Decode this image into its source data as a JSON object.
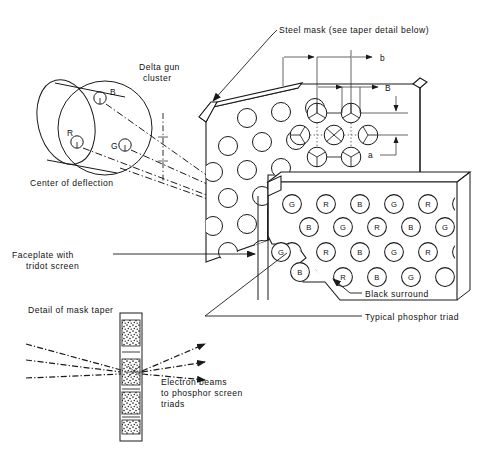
{
  "figure": {
    "type": "technical-line-diagram"
  },
  "labels": {
    "delta_gun_cluster": "Delta gun\ncluster",
    "delta_gun_cluster_line1": "Delta gun",
    "delta_gun_cluster_line2": "cluster",
    "center_of_deflection": "Center of deflection",
    "steel_mask": "Steel mask (see taper detail below)",
    "faceplate_line1": "Faceplate with",
    "faceplate_line2": "tridot screen",
    "black_surround": "Black surround",
    "typical_phosphor_triad": "Typical phosphor triad",
    "detail_of_mask_taper": "Detail of mask taper",
    "electron_beams_line1": "Electron beams",
    "electron_beams_line2": "to phosphor screen",
    "electron_beams_line3": "triads"
  },
  "gun_cluster": {
    "guns": [
      {
        "id": "B",
        "label": "B",
        "cx": 100,
        "cy": 98,
        "label_dx": 9,
        "label_dy": -4
      },
      {
        "id": "R",
        "label": "R",
        "cx": 77,
        "cy": 142,
        "label_dx": -2,
        "label_dy": -9
      },
      {
        "id": "G",
        "label": "G",
        "cx": 125,
        "cy": 145,
        "label_dx": -11,
        "label_dy": 3
      }
    ],
    "gun_radius": 6.2
  },
  "dimensions": [
    {
      "symbol": "b",
      "x": 381,
      "y": 62
    },
    {
      "symbol": "B",
      "x": 385,
      "y": 92
    },
    {
      "symbol": "a",
      "x": 371,
      "y": 152
    }
  ],
  "mask": {
    "description": "perforated steel shadow mask with staggered round apertures",
    "hole_radius": 9.5,
    "detail_hole_radius": 9.8,
    "detail_note": "apertures in detail zone show three-way phosphor wedge division"
  },
  "screen": {
    "description": "faceplate with tridot phosphor screen, black surround",
    "dot_radius": 9.4,
    "rows": [
      [
        "G",
        "R",
        "B",
        "G",
        "R",
        "B"
      ],
      [
        "B",
        "G",
        "R",
        "B",
        "G",
        ""
      ],
      [
        "G",
        "R",
        "B",
        "G",
        "R",
        "B"
      ],
      [
        "",
        "R",
        "B",
        "G",
        ""
      ]
    ],
    "phosphor_letters": [
      "R",
      "G",
      "B"
    ]
  },
  "taper_detail": {
    "caption": "Detail of mask taper",
    "beam_count": 3,
    "strip_segments": 4,
    "note": "tapered apertures through mask thickness"
  },
  "colors": {
    "ink": "#1a1a1a",
    "paper": "#ffffff",
    "hatch": "#333333"
  }
}
